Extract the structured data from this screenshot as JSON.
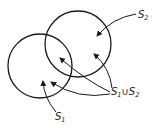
{
  "diagram": {
    "type": "venn",
    "sets": [
      {
        "id": "s1",
        "label": "S",
        "subscript": "1",
        "cx": 40,
        "cy": 66,
        "r": 32
      },
      {
        "id": "s2",
        "label": "S",
        "subscript": "2",
        "cx": 78,
        "cy": 44,
        "r": 33
      }
    ],
    "union_label": {
      "prefix": "S",
      "sub1": "1",
      "op": "∪",
      "mid": "S",
      "sub2": "2"
    },
    "stroke_color": "#1a1a1a",
    "background": "#ffffff"
  }
}
